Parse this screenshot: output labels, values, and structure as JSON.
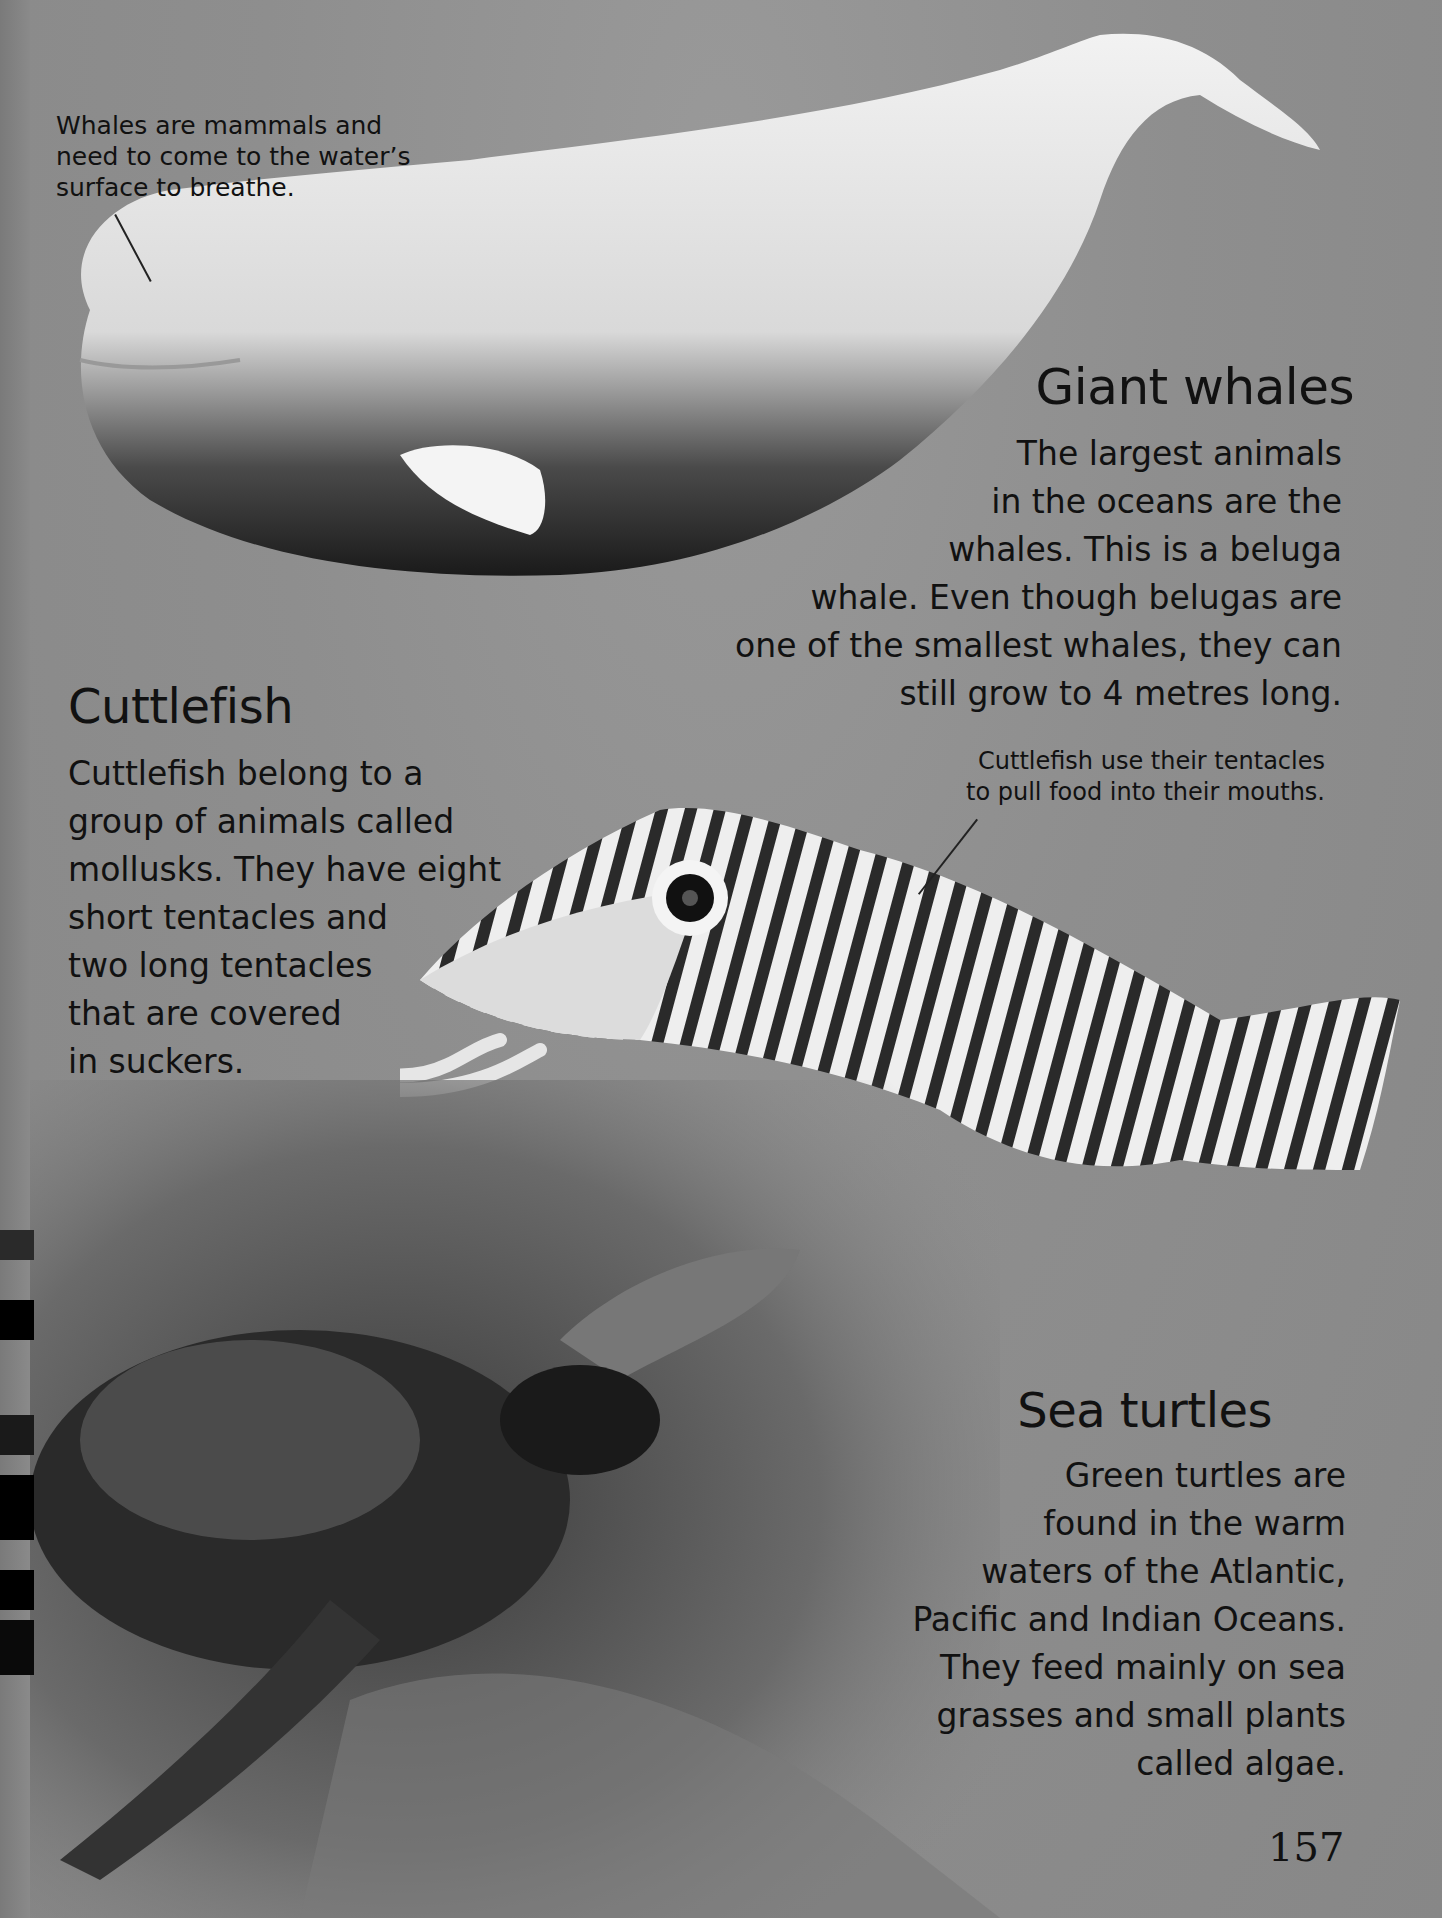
{
  "page": {
    "number": "157",
    "background_color": "#8c8c8c",
    "text_color": "#111111"
  },
  "whale_section": {
    "caption": "Whales are mammals and\nneed to come to the water’s\nsurface to breathe.",
    "heading": "Giant whales",
    "body": "The largest animals\nin the oceans are the\nwhales. This is a beluga\nwhale. Even though belugas are\none of the smallest whales, they can\nstill grow to 4 metres long.",
    "image": "beluga-whale-photo"
  },
  "cuttlefish_section": {
    "heading": "Cuttlefish",
    "body": "Cuttlefish belong to a\ngroup of animals called\nmollusks. They have eight\nshort tentacles and\ntwo long tentacles\nthat are covered\nin suckers.",
    "caption": "Cuttlefish use their tentacles\nto pull food into their mouths.",
    "image": "cuttlefish-photo"
  },
  "turtle_section": {
    "heading": "Sea turtles",
    "body": "Green turtles are\nfound in the warm\nwaters of the Atlantic,\nPacific and Indian Oceans.\nThey feed mainly on sea\ngrasses and small plants\ncalled algae.",
    "image": "green-sea-turtle-on-reef-photo"
  }
}
